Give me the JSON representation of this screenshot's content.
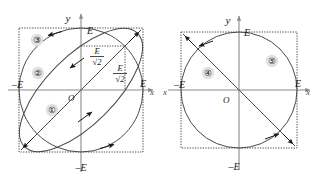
{
  "figure": {
    "background_color": "#ffffff",
    "line_color": "#4a4a4a",
    "axis_color": "#8a8a8a",
    "arrow_color": "#1a1a1a",
    "label_color": "#1a1a1a",
    "badge_fill": "#e0e0e0"
  },
  "panels": [
    {
      "id": "left-panel",
      "name": "elliptical-polarization-panel",
      "center": {
        "x": 81,
        "y": 90
      },
      "extent": 62,
      "axes": {
        "y_label": "y",
        "x_label": "x",
        "origin_label": "O",
        "y_pos_label": "E",
        "y_neg_label": "–E",
        "x_pos_label": "E",
        "x_neg_label": "–E"
      },
      "value_labels": [
        {
          "name": "e-over-root2-upper",
          "numerator": "E",
          "denominator": "√2",
          "x": 97,
          "y": 55
        },
        {
          "name": "e-over-root2-lower",
          "numerator": "E",
          "denominator": "√2",
          "x": 120,
          "y": 72
        }
      ],
      "curves": [
        {
          "name": "curve-1-linear-diagonal",
          "badge": "①",
          "badge_x": 52,
          "badge_y": 110,
          "type": "line"
        },
        {
          "name": "curve-2-ellipse",
          "badge": "②",
          "badge_x": 38,
          "badge_y": 73,
          "type": "ellipse"
        },
        {
          "name": "curve-3-circle",
          "badge": "③",
          "badge_x": 37,
          "badge_y": 40,
          "type": "circle"
        }
      ]
    },
    {
      "id": "right-panel",
      "name": "circular-polarization-panel",
      "center": {
        "x": 239,
        "y": 90
      },
      "extent": 58,
      "axes": {
        "y_label": "y",
        "x_label": "x",
        "x_label_left": "x",
        "origin_label": "O",
        "y_pos_label": "E",
        "y_neg_label": "–E",
        "x_pos_label": "E",
        "x_neg_label": "–E"
      },
      "value_labels": [],
      "curves": [
        {
          "name": "curve-4-linear-antidiagonal",
          "badge": "④",
          "badge_x": 208,
          "badge_y": 73,
          "type": "line"
        },
        {
          "name": "curve-5-circle",
          "badge": "⑤",
          "badge_x": 272,
          "badge_y": 61,
          "type": "circle"
        }
      ]
    }
  ]
}
